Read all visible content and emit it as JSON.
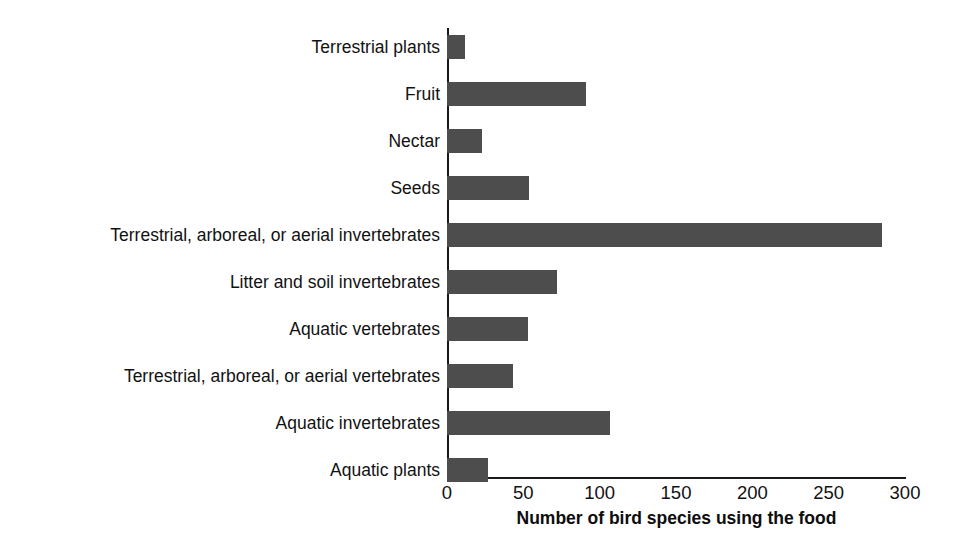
{
  "chart_data": {
    "type": "bar",
    "orientation": "horizontal",
    "title": "",
    "xlabel": "Number of bird species using the food",
    "ylabel": "",
    "xlim": [
      0,
      300
    ],
    "xticks": [
      0,
      50,
      100,
      150,
      200,
      250,
      300
    ],
    "xticklabels": [
      "0",
      "50",
      "100",
      "150",
      "200",
      "250",
      "300"
    ],
    "grid": false,
    "legend": null,
    "bar_color": "#4d4d4d",
    "axis_color": "#1a1a1a",
    "categories": [
      "Terrestrial plants",
      "Fruit",
      "Nectar",
      "Seeds",
      "Terrestrial, arboreal, or aerial invertebrates",
      "Litter and soil invertebrates",
      "Aquatic vertebrates",
      "Terrestrial, arboreal, or aerial vertebrates",
      "Aquatic invertebrates",
      "Aquatic plants"
    ],
    "values": [
      12,
      91,
      23,
      54,
      285,
      72,
      53,
      43,
      107,
      27
    ],
    "bars": [
      {
        "label": "Terrestrial plants",
        "value": 12
      },
      {
        "label": "Fruit",
        "value": 91
      },
      {
        "label": "Nectar",
        "value": 23
      },
      {
        "label": "Seeds",
        "value": 54
      },
      {
        "label": "Terrestrial, arboreal, or aerial invertebrates",
        "value": 285
      },
      {
        "label": "Litter and soil invertebrates",
        "value": 72
      },
      {
        "label": "Aquatic vertebrates",
        "value": 53
      },
      {
        "label": "Terrestrial, arboreal, or aerial vertebrates",
        "value": 43
      },
      {
        "label": "Aquatic invertebrates",
        "value": 107
      },
      {
        "label": "Aquatic plants",
        "value": 27
      }
    ]
  }
}
